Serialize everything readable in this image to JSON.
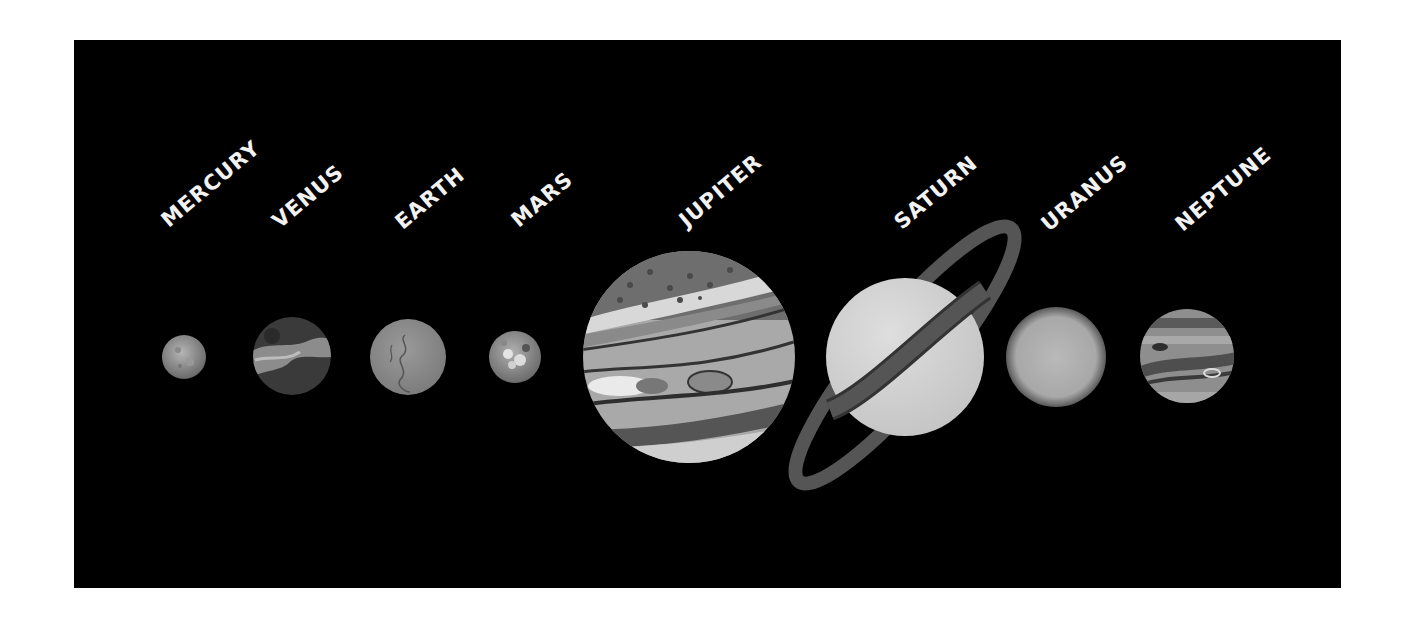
{
  "planets": [
    {
      "name": "MERCURY"
    },
    {
      "name": "VENUS"
    },
    {
      "name": "EARTH"
    },
    {
      "name": "MARS"
    },
    {
      "name": "JUPITER"
    },
    {
      "name": "SATURN"
    },
    {
      "name": "URANUS"
    },
    {
      "name": "NEPTUNE"
    }
  ],
  "colors": {
    "background": "#000000",
    "label": "#f2f2f2"
  }
}
